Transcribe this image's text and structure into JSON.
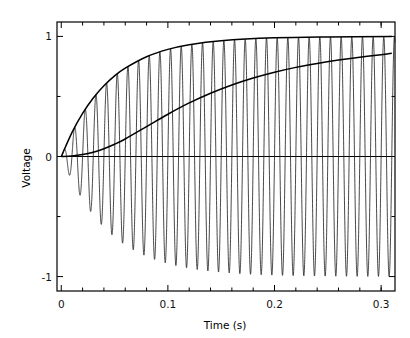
{
  "chart_data": {
    "type": "line",
    "title": "",
    "xlabel": "Time (s)",
    "ylabel": "Voltage",
    "xlim": [
      -0.004,
      0.313
    ],
    "ylim": [
      -1.12,
      1.12
    ],
    "grid": false,
    "legend": "none",
    "x_ticks": [
      0,
      0.1,
      0.2,
      0.3
    ],
    "x_tick_labels": [
      "0",
      "0.1",
      "0.2",
      "0.3"
    ],
    "x_minor_ticks": [
      0.02,
      0.04,
      0.06,
      0.08,
      0.12,
      0.14,
      0.16,
      0.18,
      0.22,
      0.24,
      0.26,
      0.28,
      0.3
    ],
    "y_ticks": [
      -1,
      0,
      1
    ],
    "y_tick_labels": [
      "-1",
      "0",
      "1"
    ],
    "y_minor_ticks": [
      -0.5,
      0.5
    ],
    "series": [
      {
        "name": "oscillation",
        "description": "100 Hz sinusoid with exponentially rising amplitude",
        "frequency_hz": 100,
        "tau_s": 0.045,
        "amplitude": 1.0,
        "color": "#1a1a1a",
        "linewidth": 0.8
      },
      {
        "name": "upper-envelope",
        "description": "exponential saturation envelope 1 - exp(-t/tau)",
        "tau_s": 0.045,
        "asymptote": 1.0,
        "color": "#000000",
        "linewidth": 1.5,
        "points": [
          [
            0.0,
            0.0
          ],
          [
            0.01,
            0.199
          ],
          [
            0.02,
            0.359
          ],
          [
            0.03,
            0.487
          ],
          [
            0.04,
            0.589
          ],
          [
            0.05,
            0.671
          ],
          [
            0.06,
            0.736
          ],
          [
            0.08,
            0.831
          ],
          [
            0.1,
            0.892
          ],
          [
            0.12,
            0.931
          ],
          [
            0.15,
            0.964
          ],
          [
            0.2,
            0.988
          ],
          [
            0.25,
            0.996
          ],
          [
            0.31,
            0.999
          ]
        ]
      },
      {
        "name": "slow-rise-curve",
        "description": "slower sigmoidal rise toward 0.9",
        "color": "#000000",
        "linewidth": 1.5,
        "points": [
          [
            0.0,
            0.0
          ],
          [
            0.01,
            0.004
          ],
          [
            0.02,
            0.016
          ],
          [
            0.03,
            0.036
          ],
          [
            0.04,
            0.065
          ],
          [
            0.05,
            0.102
          ],
          [
            0.06,
            0.146
          ],
          [
            0.08,
            0.249
          ],
          [
            0.1,
            0.352
          ],
          [
            0.12,
            0.446
          ],
          [
            0.14,
            0.527
          ],
          [
            0.16,
            0.596
          ],
          [
            0.18,
            0.654
          ],
          [
            0.2,
            0.702
          ],
          [
            0.22,
            0.742
          ],
          [
            0.24,
            0.775
          ],
          [
            0.26,
            0.803
          ],
          [
            0.28,
            0.827
          ],
          [
            0.3,
            0.848
          ],
          [
            0.31,
            0.86
          ]
        ]
      },
      {
        "name": "zero-baseline",
        "description": "horizontal reference line at 0 V",
        "value": 0,
        "color": "#000000",
        "linewidth": 1.2
      }
    ]
  },
  "axes": {
    "frame_color": "#000000"
  }
}
